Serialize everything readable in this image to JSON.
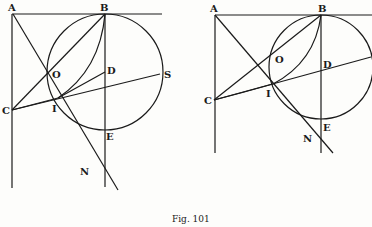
{
  "figure": {
    "caption": "Fig. 101",
    "left": {
      "labels": {
        "A": "A",
        "B": "B",
        "C": "C",
        "O": "O",
        "I": "I",
        "D": "D",
        "S": "S",
        "E": "E",
        "N": "N"
      }
    },
    "right": {
      "labels": {
        "A": "A",
        "B": "B",
        "C": "C",
        "O": "O",
        "I": "I",
        "D": "D",
        "E": "E",
        "N": "N"
      }
    },
    "colors": {
      "ink": "#1a1a1a",
      "paper": "#fdfdfb"
    }
  }
}
